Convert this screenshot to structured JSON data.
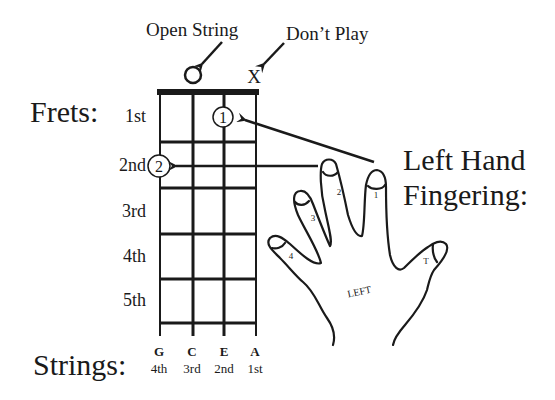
{
  "title_labels": {
    "open_string": "Open String",
    "dont_play": "Don’t Play",
    "frets": "Frets:",
    "strings": "Strings:",
    "left_hand_line1": "Left Hand",
    "left_hand_line2": "Fingering:"
  },
  "markers": {
    "open": "O",
    "mute": "X"
  },
  "frets": [
    "1st",
    "2nd",
    "3rd",
    "4th",
    "5th"
  ],
  "strings": [
    {
      "note": "G",
      "number": "4th"
    },
    {
      "note": "C",
      "number": "3rd"
    },
    {
      "note": "E",
      "number": "2nd"
    },
    {
      "note": "A",
      "number": "1st"
    }
  ],
  "finger_positions": [
    {
      "finger": "1",
      "string": "E",
      "fret": "1st"
    },
    {
      "finger": "2",
      "string": "G",
      "fret": "2nd"
    }
  ],
  "hand": {
    "palm_label": "LEFT",
    "fingers": [
      "1",
      "2",
      "3",
      "4"
    ],
    "thumb": "T"
  }
}
